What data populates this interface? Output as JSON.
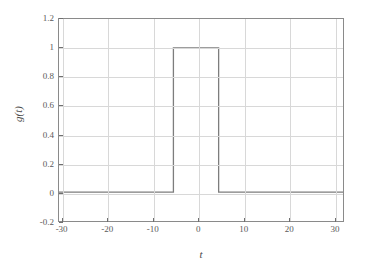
{
  "chart_data": {
    "type": "line",
    "title": "",
    "xlabel": "t",
    "ylabel": "g(t)",
    "xlim": [
      -30.8,
      32.0
    ],
    "ylim": [
      -0.2,
      1.2
    ],
    "grid": true,
    "legend": null,
    "x_ticks": [
      -30,
      -20,
      -10,
      0,
      10,
      20,
      30
    ],
    "x_ticklabels": [
      "-30",
      "-20",
      "-10",
      "0",
      "10",
      "20",
      "30"
    ],
    "y_ticks": [
      -0.2,
      0,
      0.2,
      0.4,
      0.6,
      0.8,
      1,
      1.2
    ],
    "y_ticklabels": [
      "-0.2",
      "0",
      "0.2",
      "0.4",
      "0.6",
      "0.8",
      "1",
      "1.2"
    ],
    "series": [
      {
        "name": "g(t)",
        "color": "#7d7d7d",
        "description": "rectangular pulse of amplitude 1 from t = -5.5 to t = 4.5, zero elsewhere",
        "x": [
          -30.8,
          -5.5,
          -5.5,
          4.5,
          4.5,
          32.0
        ],
        "y": [
          0,
          0,
          1,
          1,
          0,
          0
        ]
      }
    ]
  },
  "axis_label_x": "t",
  "axis_label_y": "g(t)"
}
